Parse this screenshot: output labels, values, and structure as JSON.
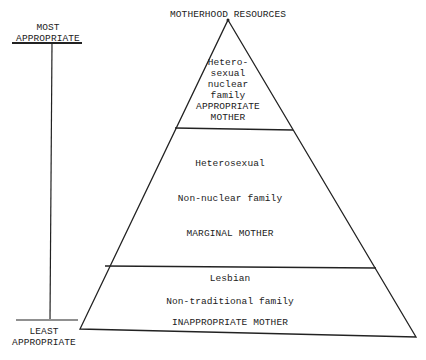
{
  "title": "MOTHERHOOD RESOURCES",
  "scale": {
    "top_label_lines": [
      "MOST",
      "APPROPRIATE"
    ],
    "bottom_label_lines": [
      "LEAST",
      "APPROPRIATE"
    ]
  },
  "tiers": [
    {
      "level": "top",
      "lines": [
        "Hetero-",
        "sexual",
        "nuclear",
        "family",
        "APPROPRIATE",
        "MOTHER"
      ]
    },
    {
      "level": "middle",
      "lines": [
        "Heterosexual",
        "Non-nuclear family",
        "MARGINAL MOTHER"
      ]
    },
    {
      "level": "bottom",
      "lines": [
        "Lesbian",
        "Non-traditional family",
        "INAPPROPRIATE MOTHER"
      ]
    }
  ],
  "colors": {
    "ink": "#222222",
    "background": "#ffffff"
  }
}
